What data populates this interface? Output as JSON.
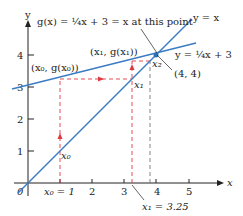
{
  "figure": {
    "title_annotation": "g(x) = ¼x + 3 = x at this point",
    "colors": {
      "line": "#3a7cc4",
      "dashed": "#e0393e",
      "axis": "#222222",
      "point": "#2a6fb8"
    },
    "axes": {
      "x_label": "x",
      "y_label": "y",
      "origin_label": "0",
      "x_ticks": [
        "1",
        "2",
        "3",
        "4",
        "5"
      ],
      "y_ticks": [
        "1",
        "2",
        "3",
        "4"
      ]
    },
    "lines": [
      {
        "name": "identity",
        "label": "y = x"
      },
      {
        "name": "g",
        "label": "y = ¼x + 3"
      }
    ],
    "points": [
      {
        "label": "(x₀, g(x₀))"
      },
      {
        "label": "(x₁, g(x₁))"
      },
      {
        "label": "x₀"
      },
      {
        "label": "x₁"
      },
      {
        "label": "x₂"
      },
      {
        "label": "(4, 4)"
      }
    ],
    "axis_annotations": {
      "x0": "x₀ = 1",
      "x1": "x₁ = 3.25"
    }
  }
}
